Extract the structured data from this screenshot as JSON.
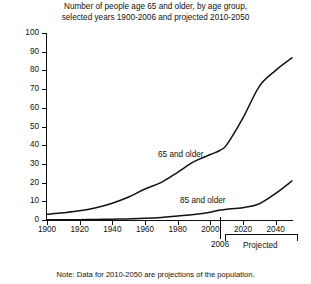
{
  "chart_data": {
    "type": "line",
    "title": "Number of people age 65 and older, by age group, selected years 1900-2006 and projected 2010-2050",
    "title_line1": "Number of people age 65 and older, by age group,",
    "title_line2": "selected years 1900-2006 and projected 2010-2050",
    "xlabel": "",
    "ylabel": "Millions",
    "xlim": [
      1900,
      2050
    ],
    "ylim": [
      0,
      100
    ],
    "grid": false,
    "legend_position": "inline-annotation",
    "yticks": [
      0,
      10,
      20,
      30,
      40,
      50,
      60,
      70,
      80,
      90,
      100
    ],
    "ytick_labels": [
      "0",
      "10",
      "20",
      "30",
      "40",
      "50",
      "60",
      "70",
      "80",
      "90",
      "100"
    ],
    "xticks": [
      1900,
      1920,
      1940,
      1960,
      1980,
      2000,
      2020,
      2040
    ],
    "xtick_labels": [
      "1900",
      "1920",
      "1940",
      "1960",
      "1980",
      "2000",
      "2020",
      "2040"
    ],
    "series": [
      {
        "name": "65 and older",
        "label_text": "65 and older",
        "x": [
          1900,
          1910,
          1920,
          1930,
          1940,
          1950,
          1960,
          1970,
          1980,
          1990,
          2000,
          2006,
          2010,
          2020,
          2030,
          2040,
          2050
        ],
        "values": [
          3.1,
          3.9,
          4.9,
          6.6,
          9.0,
          12.3,
          16.6,
          20.1,
          25.5,
          31.2,
          35.0,
          37.3,
          40.2,
          54.6,
          71.5,
          80.0,
          86.7
        ]
      },
      {
        "name": "85 and older",
        "label_text": "85 and older",
        "x": [
          1900,
          1910,
          1920,
          1930,
          1940,
          1950,
          1960,
          1970,
          1980,
          1990,
          2000,
          2006,
          2010,
          2020,
          2030,
          2040,
          2050
        ],
        "values": [
          0.1,
          0.2,
          0.2,
          0.3,
          0.4,
          0.6,
          0.9,
          1.4,
          2.2,
          3.0,
          4.2,
          5.3,
          5.8,
          6.6,
          8.7,
          14.2,
          20.9
        ]
      }
    ],
    "annotations": {
      "divider_year": 2006,
      "divider_label": "2006",
      "projected_label": "Projected",
      "projected_range": [
        2010,
        2050
      ],
      "note": "Note: Data for 2010-2050 are projections of the population."
    },
    "colors": {
      "line": "#111111",
      "axis": "#111111",
      "background": "#ffffff"
    }
  }
}
